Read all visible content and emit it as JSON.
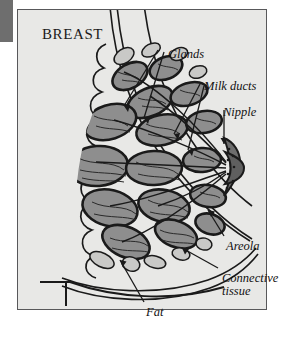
{
  "figure": {
    "title": "BREAST",
    "background_color": "#e8e8e6",
    "frame_color": "#58585a",
    "ink_color": "#1a1a1a",
    "gland_fill": "#8e8e8e",
    "fat_fill": "#c9c9c7",
    "areola_fill": "#6d6d6d"
  },
  "labels": [
    {
      "id": "glands",
      "text": "Glands",
      "x": 150,
      "y": 38
    },
    {
      "id": "milk-ducts",
      "text": "Milk ducts",
      "x": 186,
      "y": 70
    },
    {
      "id": "nipple",
      "text": "Nipple",
      "x": 205,
      "y": 96
    },
    {
      "id": "areola",
      "text": "Areola",
      "x": 208,
      "y": 230
    },
    {
      "id": "connective-tissue",
      "text": "Connective",
      "x": 204,
      "y": 262
    },
    {
      "id": "connective-tissue-line2",
      "text": "tissue",
      "x": 204,
      "y": 275
    },
    {
      "id": "fat",
      "text": "Fat",
      "x": 128,
      "y": 296
    }
  ]
}
